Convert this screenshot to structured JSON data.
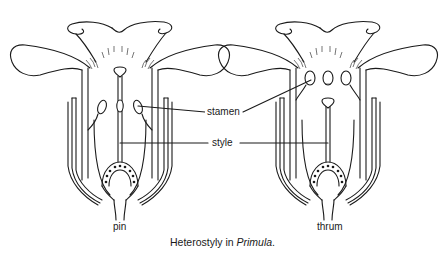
{
  "diagram": {
    "title_prefix": "Heterostyly in ",
    "title_italic": "Primula",
    "title_suffix": ".",
    "flowers": [
      {
        "id": "pin",
        "label": "pin",
        "description": "long style with stigma at corolla mouth; stamens halfway down the tube"
      },
      {
        "id": "thrum",
        "label": "thrum",
        "description": "short style with stigma halfway down; stamens at corolla mouth"
      }
    ],
    "labels": {
      "stamen": "stamen",
      "style": "style"
    },
    "colors": {
      "ink": "#1a1a1a",
      "background": "#ffffff"
    }
  }
}
